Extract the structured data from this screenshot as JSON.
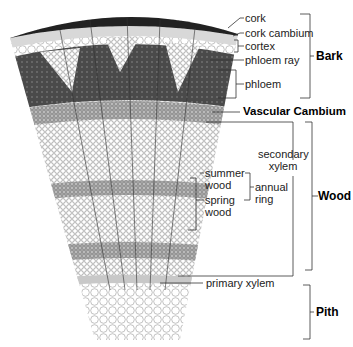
{
  "diagram": {
    "labels": {
      "cork": "cork",
      "cork_cambium": "cork cambium",
      "cortex": "cortex",
      "phloem_ray": "phloem ray",
      "phloem": "phloem",
      "vascular_cambium": "Vascular Cambium",
      "secondary_xylem_1": "secondary",
      "secondary_xylem_2": "xylem",
      "summer_wood_1": "summer",
      "summer_wood_2": "wood",
      "spring_wood_1": "spring",
      "spring_wood_2": "wood",
      "annual_ring_1": "annual",
      "annual_ring_2": "ring",
      "primary_xylem": "primary xylem"
    },
    "groups": {
      "bark": "Bark",
      "wood": "Wood",
      "pith": "Pith"
    },
    "colors": {
      "line": "#333333",
      "bark_dark": "#2a2a2a",
      "phloem": "#4a4a4a",
      "xylem": "#9a9a9a",
      "pith": "#ffffff"
    }
  }
}
